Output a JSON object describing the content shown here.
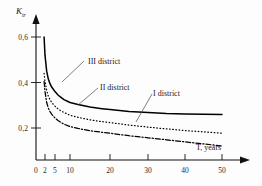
{
  "chart_data": {
    "type": "line",
    "title": "",
    "xlabel": "T, years",
    "ylabel": "K_tr",
    "ylabel_main": "K",
    "ylabel_sub": "tr",
    "xticks": [
      0,
      2,
      5,
      10,
      20,
      30,
      40,
      50
    ],
    "xtick_labels": [
      "0",
      "2",
      "5",
      "10",
      "20",
      "30",
      "40",
      "50"
    ],
    "yticks": [
      0.2,
      0.4,
      0.6
    ],
    "ytick_labels": [
      "0,2",
      "0,4",
      "0,6"
    ],
    "xlim": [
      0,
      53
    ],
    "ylim": [
      0,
      0.66
    ],
    "grid": false,
    "legend_position": "inline-annotations",
    "series": [
      {
        "name": "III district",
        "label": "III district",
        "style": "solid",
        "color": "#000000",
        "x": [
          1.8,
          2,
          2.5,
          3,
          3.5,
          4,
          5,
          6,
          7,
          8,
          10,
          12,
          15,
          18,
          20,
          25,
          30,
          35,
          40,
          45,
          50
        ],
        "values": [
          0.6,
          0.52,
          0.45,
          0.415,
          0.395,
          0.38,
          0.36,
          0.345,
          0.335,
          0.325,
          0.312,
          0.303,
          0.292,
          0.285,
          0.281,
          0.273,
          0.268,
          0.264,
          0.262,
          0.26,
          0.259
        ]
      },
      {
        "name": "II district",
        "label": "II district",
        "style": "dotted",
        "color": "#000000",
        "x": [
          1.8,
          2,
          2.5,
          3,
          3.5,
          4,
          5,
          6,
          7,
          8,
          10,
          12,
          15,
          18,
          20,
          25,
          30,
          35,
          40,
          45,
          50
        ],
        "values": [
          0.44,
          0.405,
          0.365,
          0.34,
          0.325,
          0.312,
          0.296,
          0.284,
          0.275,
          0.268,
          0.256,
          0.247,
          0.236,
          0.228,
          0.224,
          0.213,
          0.204,
          0.196,
          0.189,
          0.183,
          0.177
        ]
      },
      {
        "name": "I district",
        "label": "I district",
        "style": "dashdot",
        "color": "#000000",
        "x": [
          1.8,
          2,
          2.5,
          3,
          3.5,
          4,
          5,
          6,
          7,
          8,
          10,
          12,
          15,
          18,
          20,
          25,
          30,
          35,
          40,
          45,
          50
        ],
        "values": [
          0.405,
          0.36,
          0.312,
          0.287,
          0.272,
          0.261,
          0.244,
          0.233,
          0.224,
          0.217,
          0.206,
          0.198,
          0.188,
          0.181,
          0.177,
          0.166,
          0.157,
          0.148,
          0.139,
          0.13,
          0.121
        ]
      }
    ],
    "annotations": [
      {
        "text": "III district",
        "label_x": 88,
        "label_y": 57,
        "leader_from_x": 84,
        "leader_from_y": 61,
        "leader_to_x": 62,
        "leader_to_y": 82
      },
      {
        "text": "II district",
        "label_x": 100,
        "label_y": 83,
        "leader_from_x": 98,
        "leader_from_y": 88,
        "leader_to_x": 78,
        "leader_to_y": 105
      },
      {
        "text": "I district",
        "label_x": 153,
        "label_y": 89,
        "leader_from_x": 152,
        "leader_from_y": 94,
        "leader_to_x": 136,
        "leader_to_y": 122
      }
    ]
  }
}
